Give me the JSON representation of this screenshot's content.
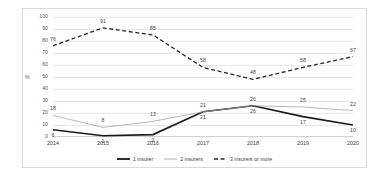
{
  "chart_data": {
    "type": "line",
    "title": "",
    "xlabel": "",
    "ylabel": "%",
    "ylim": [
      0,
      100
    ],
    "ytick_step": 10,
    "grid": true,
    "legend_position": "bottom-center",
    "categories": [
      "2014",
      "2015",
      "2016",
      "2017",
      "2018",
      "2019",
      "2020"
    ],
    "yticks": [
      "0",
      "10",
      "20",
      "30",
      "40",
      "50",
      "60",
      "70",
      "80",
      "90",
      "100"
    ],
    "series": [
      {
        "name": "1 insurer",
        "values": [
          6,
          1,
          2,
          21,
          26,
          17,
          10
        ],
        "style": "solid-thick",
        "color": "#1a1a1a"
      },
      {
        "name": "2 insurers",
        "values": [
          18,
          8,
          13,
          21,
          26,
          25,
          22
        ],
        "style": "solid-thin",
        "color": "#a6a6a6"
      },
      {
        "name": "3 insurers or more",
        "values": [
          76,
          91,
          85,
          58,
          48,
          58,
          67
        ],
        "style": "dashed",
        "color": "#262626"
      }
    ]
  },
  "colors": {
    "series1": "#1a1a1a",
    "series2": "#a6a6a6",
    "series3": "#262626",
    "grid": "#e8e8e8",
    "border": "#d9d9d9",
    "text": "#404040"
  }
}
